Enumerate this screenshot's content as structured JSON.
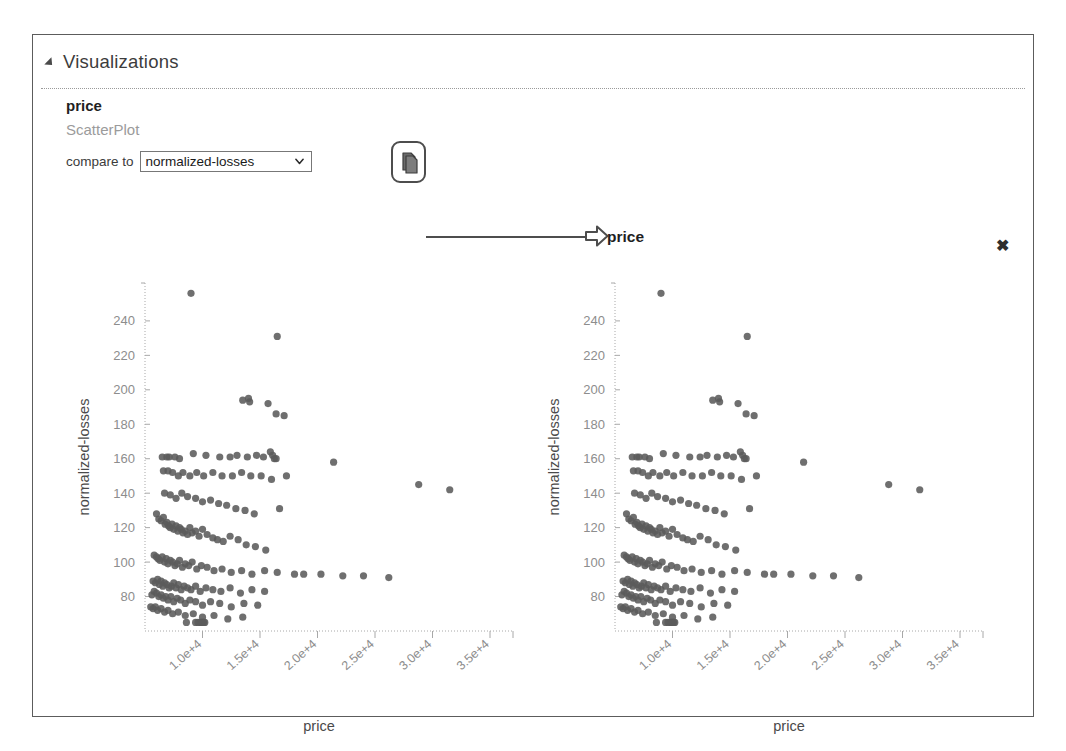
{
  "panel": {
    "title": "Visualizations",
    "collapse_icon": "triangle-collapse-icon"
  },
  "viz": {
    "title": "price",
    "subtitle": "ScatterPlot",
    "compare_label": "compare to",
    "compare_selected": "normalized-losses",
    "compare_options": [
      "normalized-losses"
    ],
    "copy_icon": "copy-icon",
    "chevron_icon": "chevron-down-icon",
    "arrow_icon": "arrow-right-icon",
    "arrow_label": "price",
    "close_icon": "✖"
  },
  "chart_data": [
    {
      "id": "left",
      "type": "scatter",
      "title": "",
      "xlabel": "price",
      "ylabel": "normalized-losses",
      "xlim": [
        5000,
        37000
      ],
      "ylim": [
        60,
        262
      ],
      "xticks": [
        10000,
        15000,
        20000,
        25000,
        30000,
        35000
      ],
      "xticklabels": [
        "1.0e+4",
        "1.5e+4",
        "2.0e+4",
        "2.5e+4",
        "3.0e+4",
        "3.5e+4"
      ],
      "yticks": [
        80,
        100,
        120,
        140,
        160,
        180,
        200,
        220,
        240
      ],
      "yticklabels": [
        "80",
        "100",
        "120",
        "140",
        "160",
        "180",
        "200",
        "220",
        "240"
      ],
      "grid": false,
      "marker_color": "#5b5b5b",
      "x": [
        9000,
        16500,
        13500,
        14000,
        14100,
        15700,
        16400,
        17100,
        6500,
        6900,
        7100,
        7600,
        8000,
        9200,
        10300,
        11500,
        12400,
        13000,
        13900,
        14700,
        15300,
        15900,
        16100,
        16250,
        16400,
        21400,
        6600,
        7000,
        7400,
        7900,
        8300,
        8900,
        9500,
        10100,
        10900,
        11700,
        12600,
        13400,
        14200,
        15100,
        16000,
        17300,
        28800,
        31500,
        6700,
        7200,
        7700,
        8200,
        8700,
        9400,
        10000,
        10700,
        11400,
        12100,
        12900,
        13700,
        14500,
        16700,
        6000,
        6200,
        6400,
        6600,
        6750,
        6900,
        7050,
        7200,
        7350,
        7500,
        7700,
        7850,
        8000,
        8150,
        8300,
        8500,
        8700,
        8900,
        9100,
        9400,
        9700,
        10000,
        10400,
        10900,
        11300,
        11800,
        12400,
        13100,
        13800,
        14600,
        15500,
        5800,
        6000,
        6150,
        6300,
        6500,
        6700,
        6850,
        7000,
        7200,
        7400,
        7600,
        7800,
        8000,
        8250,
        8500,
        8800,
        9100,
        9500,
        9900,
        10400,
        11000,
        11700,
        12500,
        13400,
        14300,
        15400,
        16500,
        18000,
        18800,
        20300,
        22200,
        24000,
        26200,
        5700,
        5900,
        6100,
        6250,
        6400,
        6550,
        6700,
        6900,
        7100,
        7300,
        7500,
        7700,
        7900,
        8150,
        8400,
        8700,
        9000,
        9400,
        9800,
        10300,
        10900,
        11600,
        12400,
        13300,
        14300,
        15400,
        5600,
        5800,
        6000,
        6200,
        6400,
        6600,
        6800,
        7000,
        7250,
        7500,
        7800,
        8100,
        8500,
        8900,
        9400,
        10000,
        10700,
        11500,
        12500,
        13600,
        14800,
        5500,
        5700,
        5900,
        6100,
        6400,
        6700,
        7000,
        7400,
        7900,
        8500,
        9200,
        10000,
        11000,
        12200,
        13500,
        8600,
        9400,
        9600,
        9800,
        9900,
        10000,
        10100,
        10200
      ],
      "y": [
        256,
        231,
        194,
        195,
        193,
        192,
        186,
        185,
        161,
        161,
        161,
        161,
        160,
        163,
        162,
        161,
        161,
        162,
        161,
        162,
        161,
        164,
        162,
        160,
        160,
        158,
        153,
        153,
        152,
        150,
        152,
        150,
        152,
        150,
        152,
        150,
        150,
        152,
        150,
        150,
        148,
        150,
        145,
        142,
        140,
        139,
        137,
        140,
        138,
        137,
        135,
        136,
        134,
        133,
        131,
        130,
        128,
        131,
        128,
        125,
        124,
        126,
        122,
        123,
        121,
        120,
        122,
        119,
        121,
        118,
        120,
        119,
        117,
        118,
        116,
        120,
        117,
        118,
        115,
        119,
        116,
        114,
        113,
        112,
        115,
        113,
        110,
        109,
        107,
        104,
        103,
        102,
        101,
        103,
        100,
        102,
        99,
        101,
        100,
        98,
        99,
        101,
        97,
        99,
        98,
        100,
        96,
        98,
        97,
        95,
        96,
        94,
        95,
        93,
        95,
        94,
        93,
        93,
        93,
        92,
        92,
        91,
        89,
        88,
        90,
        87,
        89,
        86,
        88,
        87,
        85,
        86,
        88,
        85,
        87,
        84,
        86,
        85,
        84,
        86,
        83,
        85,
        84,
        83,
        85,
        82,
        84,
        83,
        81,
        83,
        82,
        80,
        81,
        79,
        80,
        78,
        80,
        77,
        79,
        78,
        76,
        78,
        77,
        75,
        77,
        76,
        74,
        76,
        75,
        74,
        73,
        74,
        72,
        73,
        71,
        72,
        70,
        71,
        69,
        70,
        68,
        69,
        67,
        68,
        65,
        65,
        65,
        65,
        65,
        65,
        65,
        65
      ]
    },
    {
      "id": "right",
      "type": "scatter",
      "title": "",
      "xlabel": "price",
      "ylabel": "normalized-losses",
      "xlim": [
        5000,
        37000
      ],
      "ylim": [
        60,
        262
      ],
      "xticks": [
        10000,
        15000,
        20000,
        25000,
        30000,
        35000
      ],
      "xticklabels": [
        "1.0e+4",
        "1.5e+4",
        "2.0e+4",
        "2.5e+4",
        "3.0e+4",
        "3.5e+4"
      ],
      "yticks": [
        80,
        100,
        120,
        140,
        160,
        180,
        200,
        220,
        240
      ],
      "yticklabels": [
        "80",
        "100",
        "120",
        "140",
        "160",
        "180",
        "200",
        "220",
        "240"
      ],
      "grid": false,
      "marker_color": "#5b5b5b",
      "same_as": "left"
    }
  ]
}
